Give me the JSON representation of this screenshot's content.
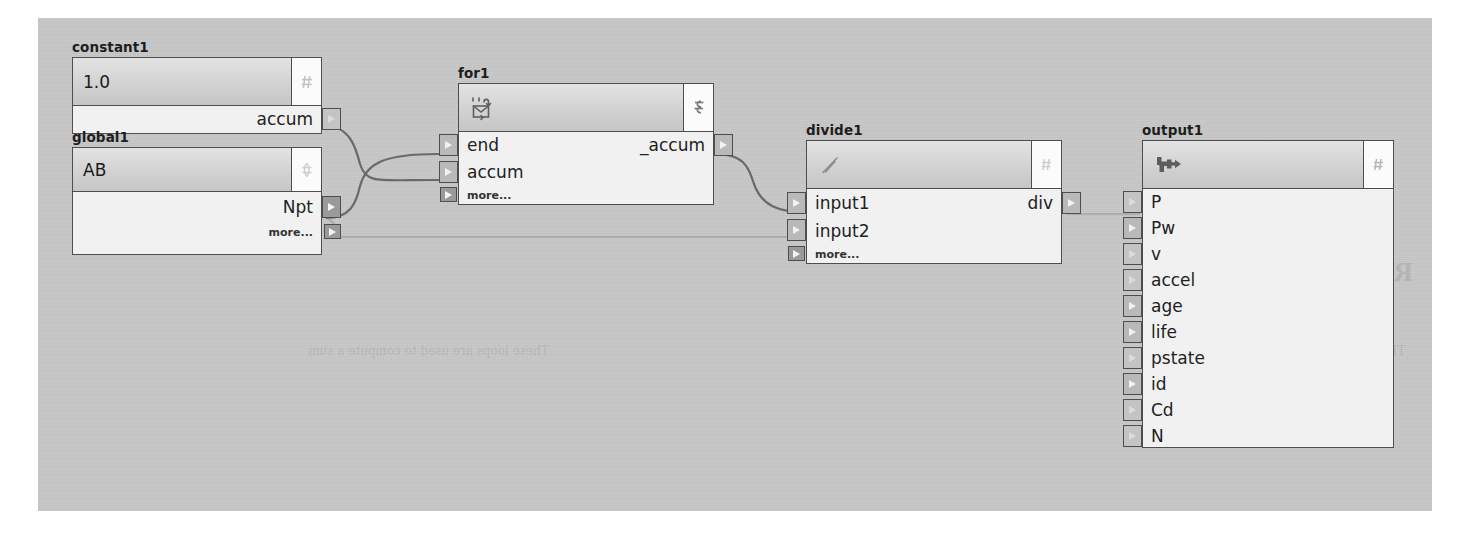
{
  "canvas": {
    "background_color": "#c8c8c8",
    "page_background": "#ffffff"
  },
  "bleed_through_text": [
    "Running a Loop",
    "for and for-each",
    "These loops are used to compute a sum",
    "Expression"
  ],
  "nodes": [
    {
      "id": "constant1",
      "title": "constant1",
      "icon": "hash-icon",
      "header_value": "1.0",
      "inputs": [],
      "outputs": [
        "accum"
      ],
      "more_label": null
    },
    {
      "id": "global1",
      "title": "global1",
      "icon": "globe-icon",
      "header_value": "AB",
      "inputs": [],
      "outputs": [
        "Npt"
      ],
      "more_label": "more..."
    },
    {
      "id": "for1",
      "title": "for1",
      "icon": "loop-icon",
      "header_value": "",
      "inputs": [
        "end",
        "accum"
      ],
      "outputs": [
        "_accum"
      ],
      "more_label": "more..."
    },
    {
      "id": "divide1",
      "title": "divide1",
      "icon": "divide-slash-icon",
      "header_value": "",
      "inputs": [
        "input1",
        "input2"
      ],
      "outputs": [
        "div"
      ],
      "more_label": "more..."
    },
    {
      "id": "output1",
      "title": "output1",
      "icon": "output-pipe-icon",
      "header_value": "",
      "inputs": [
        "P",
        "Pw",
        "v",
        "accel",
        "age",
        "life",
        "pstate",
        "id",
        "Cd",
        "N"
      ],
      "outputs": [],
      "more_label": null
    }
  ],
  "connections": [
    {
      "from_node": "constant1",
      "from_port": "accum",
      "to_node": "for1",
      "to_port": "accum",
      "strength": "strong"
    },
    {
      "from_node": "global1",
      "from_port": "Npt",
      "to_node": "for1",
      "to_port": "end",
      "strength": "strong"
    },
    {
      "from_node": "global1",
      "from_port": "Npt",
      "to_node": "divide1",
      "to_port": "input2",
      "strength": "faint"
    },
    {
      "from_node": "for1",
      "from_port": "_accum",
      "to_node": "divide1",
      "to_port": "input1",
      "strength": "strong"
    },
    {
      "from_node": "divide1",
      "from_port": "div",
      "to_node": "output1",
      "to_port": "P",
      "strength": "faint"
    }
  ]
}
